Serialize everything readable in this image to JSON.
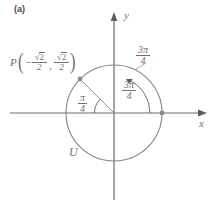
{
  "figure": {
    "panel_label": "(a)",
    "type": "unit-circle-diagram"
  },
  "axes": {
    "x_label": "x",
    "y_label": "y",
    "origin": {
      "x": 114,
      "y": 113
    },
    "x_axis": {
      "x_start": 10,
      "x_end": 207,
      "y": 113
    },
    "y_axis": {
      "y_start": 14,
      "y_end": 200,
      "x": 114
    }
  },
  "circle": {
    "name_label": "U",
    "center": {
      "x": 114,
      "y": 113
    },
    "radius": 48,
    "stroke": "#7d7d82"
  },
  "point": {
    "name": "P",
    "coord_x_sign": "−",
    "coord_x_numerator": "2",
    "coord_x_denominator": "2",
    "coord_y_numerator": "2",
    "coord_y_denominator": "2",
    "radical": "√",
    "comma": ",",
    "open_paren": "(",
    "close_paren": ")",
    "pixel": {
      "x": 80,
      "y": 79
    },
    "angle_degrees": 135
  },
  "angles": {
    "outer": {
      "numerator": "3π",
      "denominator": "4",
      "note": "label outside circle upper-right"
    },
    "inner": {
      "numerator": "3π",
      "denominator": "4",
      "note": "label inside arc from positive x-axis to P"
    },
    "reference": {
      "numerator": "π",
      "denominator": "4",
      "note": "reference angle between negative x-axis and OP"
    }
  },
  "colors": {
    "stroke": "#7d7d82",
    "axis": "#636368",
    "text": "#6f6f74",
    "background": "#ffffff"
  }
}
